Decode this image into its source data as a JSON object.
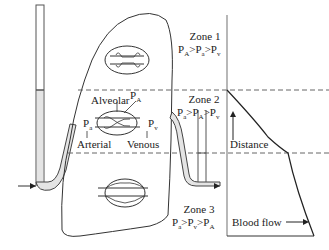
{
  "diagram": {
    "zones": [
      {
        "label": "Zone 1",
        "relation": [
          "P",
          "A",
          ">",
          "P",
          "a",
          ">",
          "P",
          "v"
        ]
      },
      {
        "label": "Zone 2",
        "relation": [
          "P",
          "a",
          ">",
          "P",
          "A",
          ">",
          "P",
          "v"
        ]
      },
      {
        "label": "Zone 3",
        "relation": [
          "P",
          "a",
          ">",
          "P",
          "v",
          ">",
          "P",
          "A"
        ]
      }
    ],
    "labels": {
      "alveolar": "Alveolar",
      "arterial": "Arterial",
      "venous": "Venous",
      "pa_main": "P",
      "pa_sub": "a",
      "pA_main": "P",
      "pA_sub": "A",
      "pv_main": "P",
      "pv_sub": "v",
      "distance": "Distance",
      "blood_flow": "Blood flow"
    },
    "colors": {
      "line": "#333333",
      "tube_fill": "#e4e4e4",
      "dash": "#666666"
    }
  }
}
